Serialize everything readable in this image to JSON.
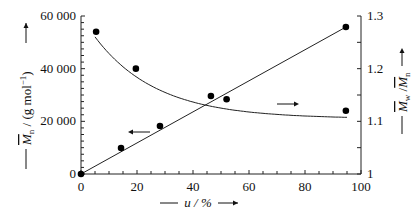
{
  "chart_data": {
    "type": "scatter",
    "title": "",
    "xlabel": "u / %",
    "ylabel": "Mn / (g mol⁻¹)",
    "ylabel_right": "Mw / Mn",
    "xlim": [
      0,
      100
    ],
    "ylim": [
      0,
      60000
    ],
    "ylim_right": [
      1.0,
      1.3
    ],
    "grid": false,
    "legend": "none (arrows indicate axis association)",
    "x_ticks": [
      "0",
      "20",
      "40",
      "60",
      "80",
      "100"
    ],
    "y_ticks": [
      "0",
      "20 000",
      "40 000",
      "60 000"
    ],
    "y_ticks_right": [
      "1",
      "1.1",
      "1.2",
      "1.3"
    ],
    "series": [
      {
        "name": "Mn",
        "axis": "left",
        "fit": "linear",
        "x": [
          0,
          14.3,
          28.2,
          94.6
        ],
        "values": [
          0,
          9900,
          18200,
          55800
        ]
      },
      {
        "name": "Mw/Mn",
        "axis": "right",
        "fit": "decaying curve",
        "x": [
          5.4,
          19.6,
          46.4,
          52.0,
          94.6
        ],
        "values": [
          1.27,
          1.2,
          1.148,
          1.142,
          1.12
        ]
      }
    ],
    "annotations": [
      {
        "text": "←",
        "meaning": "Mn points refer to left axis"
      },
      {
        "text": "→",
        "meaning": "Mw/Mn points refer to right axis"
      }
    ]
  },
  "labels": {
    "x_axis": "u / %",
    "y_left_main": "M",
    "y_left_sub": "n",
    "y_left_unit": " / (g mol",
    "y_left_sup": "−1",
    "y_left_close": ")",
    "y_right_main1": "M",
    "y_right_sub1": "w",
    "y_right_slash": " /",
    "y_right_main2": "M",
    "y_right_sub2": "n"
  }
}
